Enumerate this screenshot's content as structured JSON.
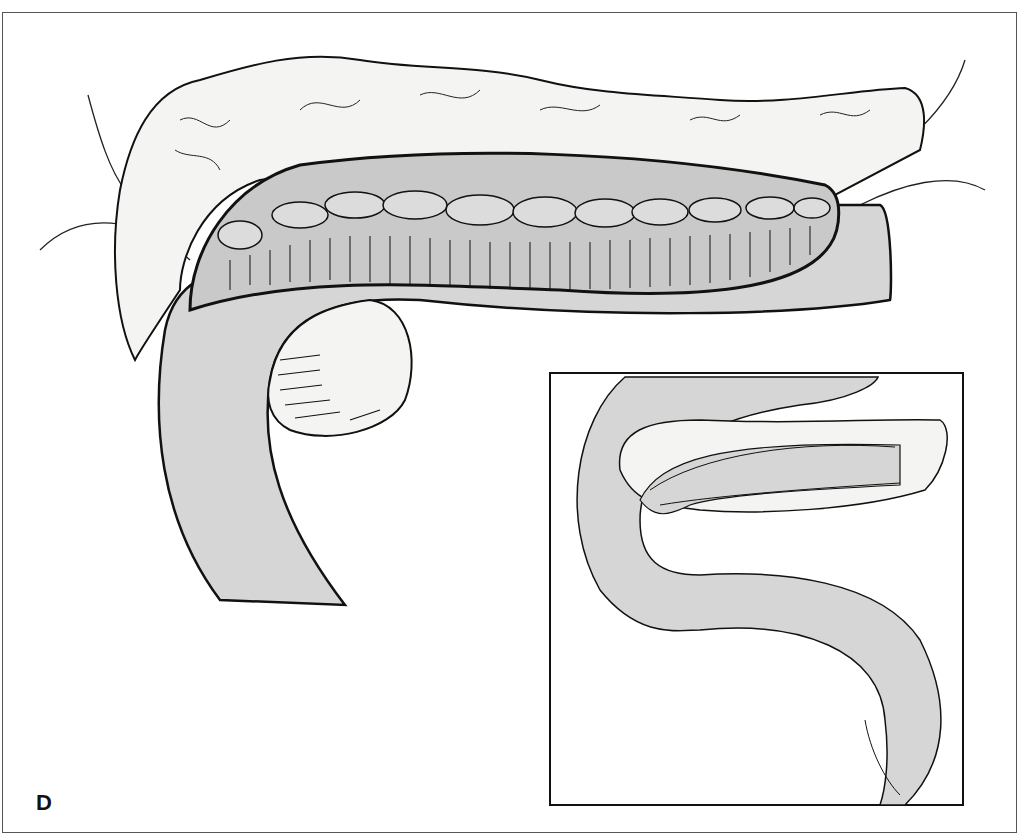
{
  "figure": {
    "panel_label": "D",
    "colors": {
      "bowel_fill": "#d6d6d6",
      "tissue_fill": "#f4f4f2",
      "line": "#111111",
      "background": "#ffffff"
    },
    "main_illustration": "pancreaticojejunostomy-open-anastomosis",
    "inset_illustration": "completed-anastomosis-with-roux-limb"
  }
}
